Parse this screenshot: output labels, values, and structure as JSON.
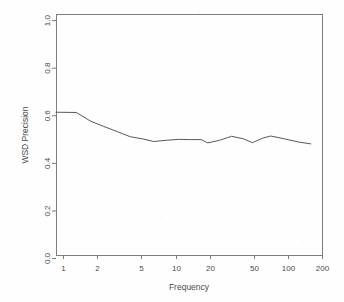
{
  "chart_data": {
    "type": "line",
    "title": "",
    "subtitle": "",
    "xlabel": "Frequency",
    "ylabel": "WSD Precision",
    "xscale": "log",
    "yscale": "linear",
    "xlim": [
      1,
      200
    ],
    "ylim": [
      0.0,
      1.0
    ],
    "grid": false,
    "legend": false,
    "legend_position": "none",
    "x_ticks": [
      1,
      2,
      5,
      10,
      20,
      50,
      100,
      200
    ],
    "x_tick_labels": [
      "1",
      "2",
      "5",
      "10",
      "20",
      "50",
      "100",
      "200"
    ],
    "y_ticks": [
      0.0,
      0.2,
      0.4,
      0.6,
      0.8,
      1.0
    ],
    "y_tick_labels": [
      "0.0",
      "0.2",
      "0.4",
      "0.6",
      "0.8",
      "1.0"
    ],
    "series": [
      {
        "name": "WSD Precision",
        "color": "#585858",
        "x": [
          1.0,
          1.5,
          2.0,
          2.6,
          3.4,
          4.4,
          5.6,
          7.0,
          9.0,
          11.5,
          14.5,
          18.0,
          20.5,
          26.0,
          33.0,
          42.0,
          50.0,
          62.0,
          72.0,
          95.0,
          125.0,
          160.0
        ],
        "y": [
          0.615,
          0.614,
          0.577,
          0.555,
          0.533,
          0.512,
          0.503,
          0.492,
          0.497,
          0.501,
          0.5,
          0.5,
          0.486,
          0.497,
          0.514,
          0.503,
          0.487,
          0.507,
          0.515,
          0.503,
          0.49,
          0.482
        ]
      }
    ],
    "annotations": []
  },
  "figure": {
    "background_color": "#fefefe",
    "axis_color": "#7d7d7d",
    "text_color": "#4a4a4a"
  }
}
